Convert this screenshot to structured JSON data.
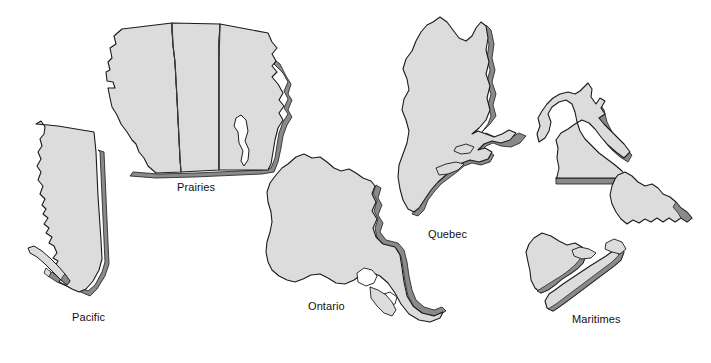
{
  "map": {
    "title": "Canada Regions",
    "canvas": {
      "width": 711,
      "height": 363
    },
    "background_color": "#ffffff",
    "style": {
      "land_fill": "#dcdcdc",
      "outline_color": "#1a1a1a",
      "shadow_fill": "#8a8a8a",
      "lake_fill": "#ffffff",
      "internal_border_color": "#3a3a3a",
      "label_color": "#111111"
    },
    "regions": [
      {
        "id": "pacific",
        "label": "Pacific",
        "label_x": 72,
        "label_y": 316,
        "provinces": [
          "British Columbia"
        ]
      },
      {
        "id": "prairies",
        "label": "Prairies",
        "label_x": 196,
        "label_y": 187,
        "provinces": [
          "Alberta",
          "Saskatchewan",
          "Manitoba"
        ]
      },
      {
        "id": "ontario",
        "label": "Ontario",
        "label_x": 329,
        "label_y": 306,
        "provinces": [
          "Ontario"
        ]
      },
      {
        "id": "quebec",
        "label": "Quebec",
        "label_x": 449,
        "label_y": 234,
        "provinces": [
          "Quebec"
        ]
      },
      {
        "id": "maritimes",
        "label": "Maritimes",
        "label_x": 600,
        "label_y": 319,
        "provinces": [
          "Newfoundland and Labrador",
          "New Brunswick",
          "Nova Scotia",
          "Prince Edward Island"
        ]
      }
    ],
    "features": [
      {
        "id": "lake-winnipeg",
        "name": "Lake Winnipeg",
        "type": "lake",
        "region": "prairies"
      },
      {
        "id": "great-lakes",
        "name": "Great Lakes",
        "type": "lake",
        "region": "ontario"
      }
    ]
  }
}
